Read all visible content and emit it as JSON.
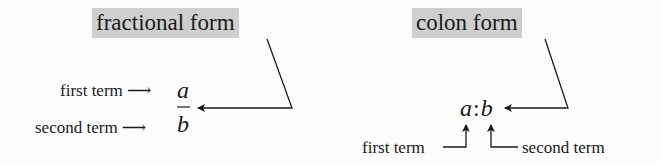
{
  "fractional": {
    "title": "fractional form",
    "first_label": "first term",
    "second_label": "second term",
    "arrow": "⟶",
    "numerator": "a",
    "denominator": "b"
  },
  "colon": {
    "title": "colon form",
    "expr_a": "a",
    "expr_sep": ":",
    "expr_b": "b",
    "first_label": "first term",
    "second_label": "second term"
  },
  "colors": {
    "header_bg": "#cfcfcf",
    "ink": "#1a1a1a"
  }
}
